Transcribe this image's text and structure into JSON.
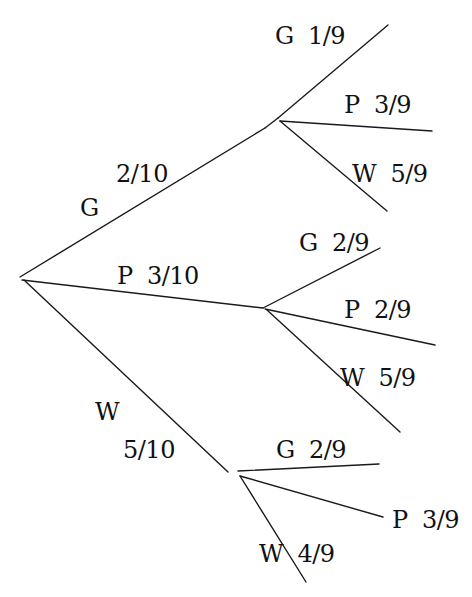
{
  "diagram": {
    "type": "probability-tree",
    "colors": {
      "line": "#1a1a1a",
      "text": "#111111",
      "background": "#ffffff"
    },
    "root": {
      "x": 20,
      "y": 277
    },
    "first_level": [
      {
        "outcome": "G",
        "probability": "2/10",
        "label_outcome": "G",
        "label_prob": "2/10",
        "node": {
          "x": 278,
          "y": 118
        },
        "second_level": [
          {
            "label": "G  1/9",
            "outcome": "G",
            "probability": "1/9",
            "end": {
              "x": 388,
              "y": 25
            }
          },
          {
            "label": "P  3/9",
            "outcome": "P",
            "probability": "3/9",
            "end": {
              "x": 432,
              "y": 131
            }
          },
          {
            "label": "W  5/9",
            "outcome": "W",
            "probability": "5/9",
            "end": {
              "x": 387,
              "y": 211
            }
          }
        ]
      },
      {
        "outcome": "P",
        "probability": "3/10",
        "label": "P  3/10",
        "node": {
          "x": 263,
          "y": 308
        },
        "second_level": [
          {
            "label": "G  2/9",
            "outcome": "G",
            "probability": "2/9",
            "end": {
              "x": 380,
              "y": 248
            }
          },
          {
            "label": "P  2/9",
            "outcome": "P",
            "probability": "2/9",
            "end": {
              "x": 435,
              "y": 345
            }
          },
          {
            "label": "W  5/9",
            "outcome": "W",
            "probability": "5/9",
            "end": {
              "x": 400,
              "y": 432
            }
          }
        ]
      },
      {
        "outcome": "W",
        "probability": "5/10",
        "label_outcome": "W",
        "label_prob": "5/10",
        "node": {
          "x": 238,
          "y": 471
        },
        "second_level": [
          {
            "label": "G  2/9",
            "outcome": "G",
            "probability": "2/9",
            "end": {
              "x": 379,
              "y": 464
            }
          },
          {
            "label": "P  3/9",
            "outcome": "P",
            "probability": "3/9",
            "end": {
              "x": 383,
              "y": 517
            }
          },
          {
            "label": "W  4/9",
            "outcome": "W",
            "probability": "4/9",
            "end": {
              "x": 306,
              "y": 582
            }
          }
        ]
      }
    ]
  }
}
